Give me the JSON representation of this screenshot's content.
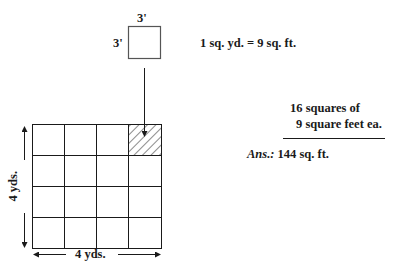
{
  "small_square": {
    "top_label": "3'",
    "left_label": "3'"
  },
  "equivalence": "1 sq. yd. = 9 sq. ft.",
  "computation": {
    "line1": "16 squares of",
    "line2": "9 square feet ea.",
    "answer_prefix": "Ans.:",
    "answer_value": "144 sq. ft."
  },
  "grid": {
    "rows": 4,
    "cols": 4,
    "hatched_cell": {
      "row": 0,
      "col": 3
    },
    "width_label": "4 yds.",
    "height_label": "4 yds."
  },
  "colors": {
    "line": "#1a1a1a",
    "background": "#ffffff"
  }
}
